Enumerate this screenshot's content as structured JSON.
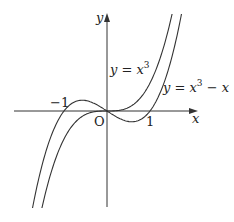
{
  "figure": {
    "colors": {
      "stroke": "#333333",
      "text": "#222222",
      "background": "#ffffff"
    },
    "origin_px": [
      107,
      111
    ],
    "scale": {
      "sx": 43,
      "sy": 28
    },
    "axes": {
      "x_axis": {
        "from_px": 14,
        "to_px": 198,
        "label": "x"
      },
      "y_axis": {
        "from_px": 207,
        "to_px": 13,
        "label": "y"
      }
    },
    "labels": {
      "origin": "O",
      "tick_pos": "1",
      "tick_neg": "−1",
      "curve1": {
        "lhs": "y = x",
        "exp": "3"
      },
      "curve2": {
        "lhs": "y = x",
        "exp": "3",
        "rhs": " − x"
      }
    },
    "curves": [
      {
        "name": "cubic",
        "formula": "y = x^3",
        "coeffs": [
          1,
          0,
          0,
          0
        ]
      },
      {
        "name": "cubic-minus-x",
        "formula": "y = x^3 - x",
        "coeffs": [
          1,
          0,
          -1,
          0
        ]
      }
    ],
    "clip_y_px": [
      14,
      207
    ]
  }
}
